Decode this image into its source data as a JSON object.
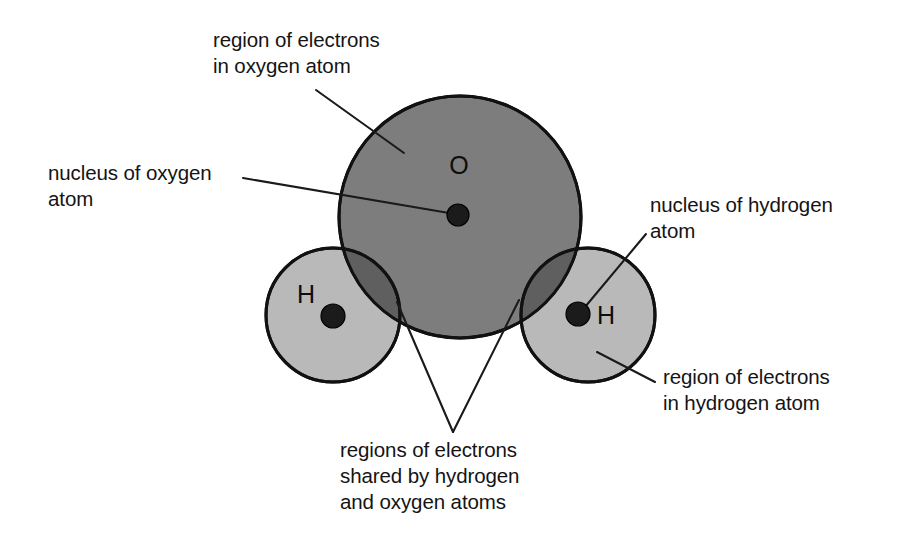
{
  "diagram": {
    "canvas": {
      "width": 911,
      "height": 539,
      "background": "#ffffff"
    },
    "colors": {
      "oxygen_shell": "#7d7d7d",
      "hydrogen_shell": "#b9b9b9",
      "overlap_region": "#5f5f5f",
      "nucleus": "#1b1b1b",
      "outline": "#111111",
      "leader_line": "#1a1a1a",
      "text": "#141414"
    },
    "atoms": [
      {
        "id": "oxygen",
        "symbol": "O",
        "shell_center": {
          "x": 460,
          "y": 217
        },
        "shell_radius": 121,
        "nucleus_center": {
          "x": 458,
          "y": 215
        },
        "nucleus_radius": 11,
        "symbol_position": {
          "x": 459,
          "y": 174
        }
      },
      {
        "id": "hydrogen-left",
        "symbol": "H",
        "shell_center": {
          "x": 333,
          "y": 315
        },
        "shell_radius": 67,
        "nucleus_center": {
          "x": 333,
          "y": 316
        },
        "nucleus_radius": 12,
        "symbol_position": {
          "x": 306,
          "y": 303
        }
      },
      {
        "id": "hydrogen-right",
        "symbol": "H",
        "shell_center": {
          "x": 588,
          "y": 315
        },
        "shell_radius": 67,
        "nucleus_center": {
          "x": 578,
          "y": 314
        },
        "nucleus_radius": 12,
        "symbol_position": {
          "x": 606,
          "y": 324
        }
      }
    ],
    "labels": [
      {
        "id": "region-electrons-oxygen",
        "lines": [
          "region of electrons",
          "in oxygen atom"
        ],
        "anchor": "start",
        "x": 213,
        "y": 47
      },
      {
        "id": "nucleus-oxygen",
        "lines": [
          "nucleus of oxygen",
          "atom"
        ],
        "anchor": "start",
        "x": 48,
        "y": 180
      },
      {
        "id": "nucleus-hydrogen",
        "lines": [
          "nucleus of hydrogen",
          "atom"
        ],
        "anchor": "start",
        "x": 650,
        "y": 212
      },
      {
        "id": "region-electrons-hydrogen",
        "lines": [
          "region of electrons",
          "in hydrogen atom"
        ],
        "anchor": "start",
        "x": 663,
        "y": 384
      },
      {
        "id": "shared-regions",
        "lines": [
          "regions of electrons",
          "shared by hydrogen",
          "and oxygen atoms"
        ],
        "anchor": "start",
        "x": 340,
        "y": 457
      }
    ],
    "leader_lines": [
      {
        "id": "leader-region-oxygen",
        "from": {
          "x": 316,
          "y": 90
        },
        "to": {
          "x": 404,
          "y": 153
        }
      },
      {
        "id": "leader-nucleus-oxygen",
        "from": {
          "x": 243,
          "y": 178
        },
        "to": {
          "x": 449,
          "y": 213
        }
      },
      {
        "id": "leader-nucleus-hydrogen",
        "from": {
          "x": 646,
          "y": 234
        },
        "to": {
          "x": 585,
          "y": 307
        }
      },
      {
        "id": "leader-region-hydrogen",
        "from": {
          "x": 655,
          "y": 382
        },
        "to": {
          "x": 597,
          "y": 352
        }
      },
      {
        "id": "leader-shared-left",
        "from": {
          "x": 453,
          "y": 432
        },
        "to": {
          "x": 397,
          "y": 302
        }
      },
      {
        "id": "leader-shared-right",
        "from": {
          "x": 453,
          "y": 432
        },
        "to": {
          "x": 519,
          "y": 300
        }
      }
    ]
  }
}
